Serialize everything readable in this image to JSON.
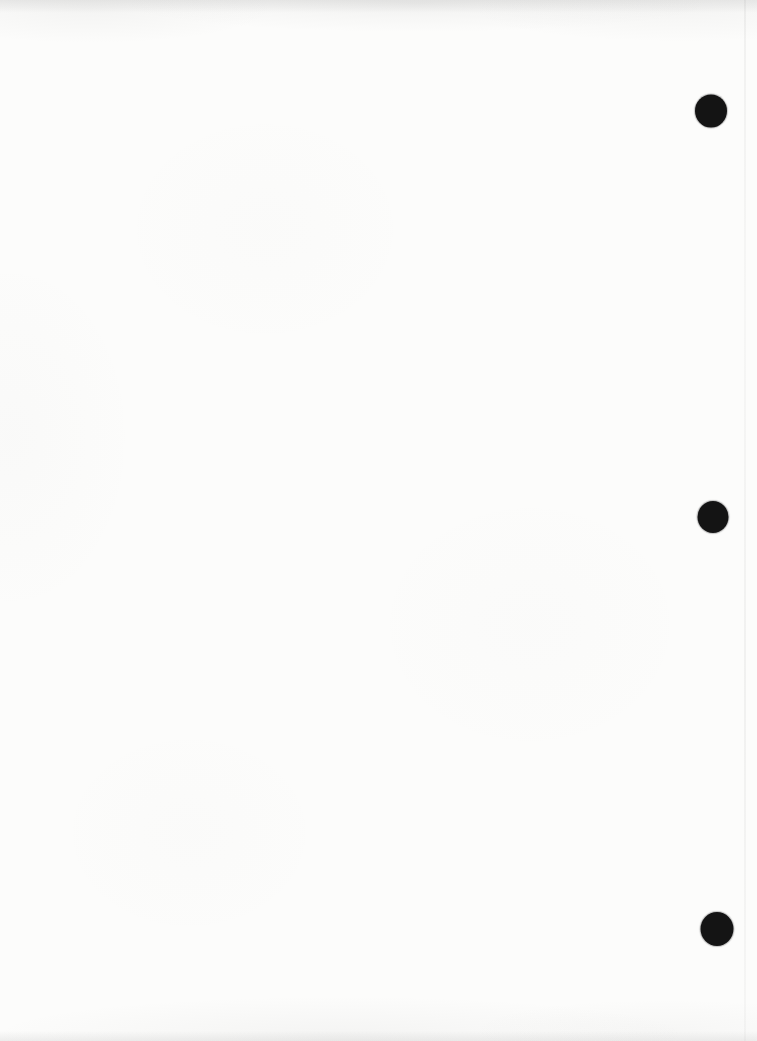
{
  "page": {
    "kind": "scanned-blank-sheet",
    "text_content": "",
    "background_color": "#fcfcfb",
    "top_edge_shade_color": "#e9e9e7",
    "bottom_edge_shade_color": "#ededeb",
    "right_scanline_color": "#d9d9d7",
    "punch_holes": {
      "color": "#141414",
      "count": 3,
      "items": [
        {
          "cx": 711,
          "cy": 111,
          "width": 32,
          "height": 33
        },
        {
          "cx": 713,
          "cy": 517,
          "width": 31,
          "height": 32
        },
        {
          "cx": 717,
          "cy": 929,
          "width": 33,
          "height": 34
        }
      ]
    }
  }
}
